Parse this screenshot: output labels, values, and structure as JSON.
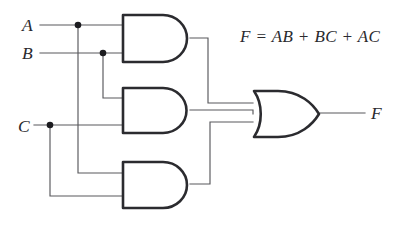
{
  "diagram": {
    "type": "logic-circuit-schematic",
    "canvas": {
      "width": 405,
      "height": 233,
      "background": "#ffffff"
    },
    "colors": {
      "wire": "#58585c",
      "gate_outline": "#2b2b2f",
      "gate_fill": "#ffffff",
      "text": "#2a2a2e",
      "junction": "#1b1b1f"
    },
    "equation": "F = AB + BC + AC",
    "inputs": [
      {
        "label": "A",
        "x": 22,
        "y": 31,
        "wire_y": 25
      },
      {
        "label": "B",
        "x": 22,
        "y": 59,
        "wire_y": 53
      },
      {
        "label": "C",
        "x": 18,
        "y": 132,
        "wire_y": 125
      }
    ],
    "outputs": [
      {
        "label": "F",
        "x": 371,
        "y": 119,
        "wire_y": 113
      }
    ],
    "junctions": [
      {
        "signal": "A",
        "x": 78,
        "y": 25
      },
      {
        "signal": "B",
        "x": 103,
        "y": 53
      },
      {
        "signal": "C",
        "x": 50,
        "y": 125
      }
    ],
    "gates": [
      {
        "id": "and-gate-1",
        "type": "AND",
        "label": "AB",
        "inputs": [
          "A",
          "B"
        ],
        "x": 122,
        "y": 14,
        "width": 68,
        "height": 48
      },
      {
        "id": "and-gate-2",
        "type": "AND",
        "label": "BC",
        "inputs": [
          "B",
          "C"
        ],
        "x": 122,
        "y": 87,
        "width": 68,
        "height": 46
      },
      {
        "id": "and-gate-3",
        "type": "AND",
        "label": "AC",
        "inputs": [
          "A",
          "C"
        ],
        "x": 122,
        "y": 161,
        "width": 68,
        "height": 47
      },
      {
        "id": "or-gate-1",
        "type": "OR",
        "label": "F",
        "inputs": [
          "AB",
          "BC",
          "AC"
        ],
        "x": 253,
        "y": 90,
        "width": 67,
        "height": 48
      }
    ]
  }
}
